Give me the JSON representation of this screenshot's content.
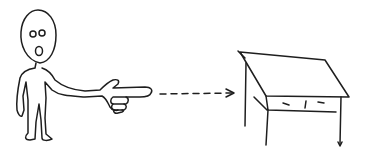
{
  "illustration": {
    "description": "Hand-drawn sketch: a stick figure points with its right hand along a dashed arrow toward a table/desk",
    "background_color": "#ffffff",
    "ink_color": "#1e1e1e",
    "elements": [
      "stick-figure",
      "pointing-hand",
      "dashed-arrow",
      "desk"
    ]
  }
}
